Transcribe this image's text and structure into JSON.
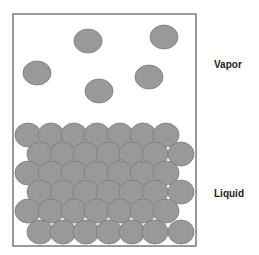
{
  "labels": {
    "vapor": "Vapor",
    "liquid": "Liquid"
  },
  "colors": {
    "particle_fill": "#999999",
    "particle_stroke": "#7a7a7a",
    "container_stroke": "#777777"
  },
  "container": {
    "x": 13,
    "y": 14,
    "width": 183,
    "height": 232
  },
  "vapor_particles": [
    {
      "cx": 88,
      "cy": 41
    },
    {
      "cx": 164,
      "cy": 37
    },
    {
      "cx": 37,
      "cy": 73
    },
    {
      "cx": 149,
      "cy": 77
    },
    {
      "cx": 99,
      "cy": 91
    }
  ],
  "liquid_layout": {
    "rows": 6,
    "rx": 13,
    "ry": 12,
    "row_y": [
      135,
      154,
      173,
      192,
      211,
      232
    ],
    "even_row_x": [
      28,
      51,
      74,
      97,
      120,
      143,
      166
    ],
    "odd_row_x": [
      40,
      63,
      86,
      109,
      132,
      155,
      181
    ]
  }
}
